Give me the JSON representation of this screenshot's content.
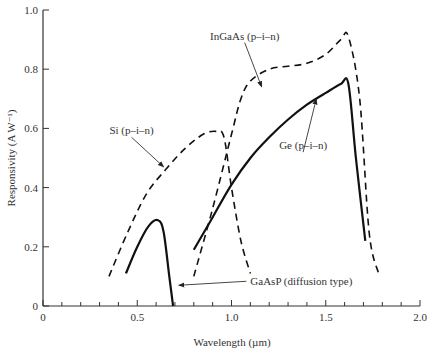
{
  "chart_data": {
    "type": "line",
    "title": "",
    "xlabel": "Wavelength (µm)",
    "ylabel": "Responsivity (A W⁻¹)",
    "xlim": [
      0,
      2.0
    ],
    "ylim": [
      0,
      1.0
    ],
    "x_ticks": [
      0,
      0.5,
      1.0,
      1.5,
      2.0
    ],
    "x_tick_labels": [
      "0",
      "0.5",
      "1.0",
      "1.5",
      "2.0"
    ],
    "x_minor_step": 0.1,
    "y_ticks": [
      0,
      0.2,
      0.4,
      0.6,
      0.8,
      1.0
    ],
    "y_tick_labels": [
      "0",
      "0.2",
      "0.4",
      "0.6",
      "0.8",
      "1.0"
    ],
    "grid": false,
    "legend": "none (inline annotations)",
    "series": [
      {
        "name": "Si (p–i–n)",
        "style": "dashed",
        "x": [
          0.35,
          0.45,
          0.55,
          0.65,
          0.75,
          0.85,
          0.92,
          0.96,
          1.0,
          1.05,
          1.1
        ],
        "y": [
          0.1,
          0.25,
          0.38,
          0.46,
          0.53,
          0.58,
          0.59,
          0.57,
          0.4,
          0.22,
          0.11
        ]
      },
      {
        "name": "GaAsP (diffusion type)",
        "style": "solid",
        "x": [
          0.44,
          0.5,
          0.56,
          0.61,
          0.64,
          0.67,
          0.69
        ],
        "y": [
          0.11,
          0.2,
          0.27,
          0.29,
          0.25,
          0.1,
          0.0
        ]
      },
      {
        "name": "Ge (p–i–n)",
        "style": "solid",
        "x": [
          0.8,
          0.9,
          1.0,
          1.1,
          1.2,
          1.3,
          1.4,
          1.5,
          1.58,
          1.62,
          1.66,
          1.71
        ],
        "y": [
          0.19,
          0.3,
          0.41,
          0.5,
          0.57,
          0.63,
          0.68,
          0.72,
          0.75,
          0.75,
          0.5,
          0.22
        ]
      },
      {
        "name": "InGaAs (p–i–n)",
        "style": "dashed",
        "x": [
          0.8,
          0.9,
          1.0,
          1.05,
          1.1,
          1.2,
          1.3,
          1.4,
          1.5,
          1.58,
          1.62,
          1.68,
          1.73,
          1.78
        ],
        "y": [
          0.1,
          0.33,
          0.58,
          0.7,
          0.76,
          0.8,
          0.81,
          0.82,
          0.85,
          0.9,
          0.91,
          0.7,
          0.25,
          0.11
        ]
      }
    ],
    "annotations": [
      {
        "text": "Si (p–i–n)",
        "label_at": [
          0.47,
          0.58
        ],
        "arrow_to": [
          0.64,
          0.47
        ]
      },
      {
        "text": "InGaAs (p–i–n)",
        "label_at": [
          1.07,
          0.9
        ],
        "arrow_to": [
          1.16,
          0.74
        ]
      },
      {
        "text": "Ge (p–i–n)",
        "label_at": [
          1.38,
          0.53
        ],
        "arrow_to": [
          1.45,
          0.7
        ]
      },
      {
        "text": "GaAsP (diffusion type)",
        "label_at": [
          1.1,
          0.07
        ],
        "arrow_to": [
          0.72,
          0.07
        ]
      }
    ]
  }
}
